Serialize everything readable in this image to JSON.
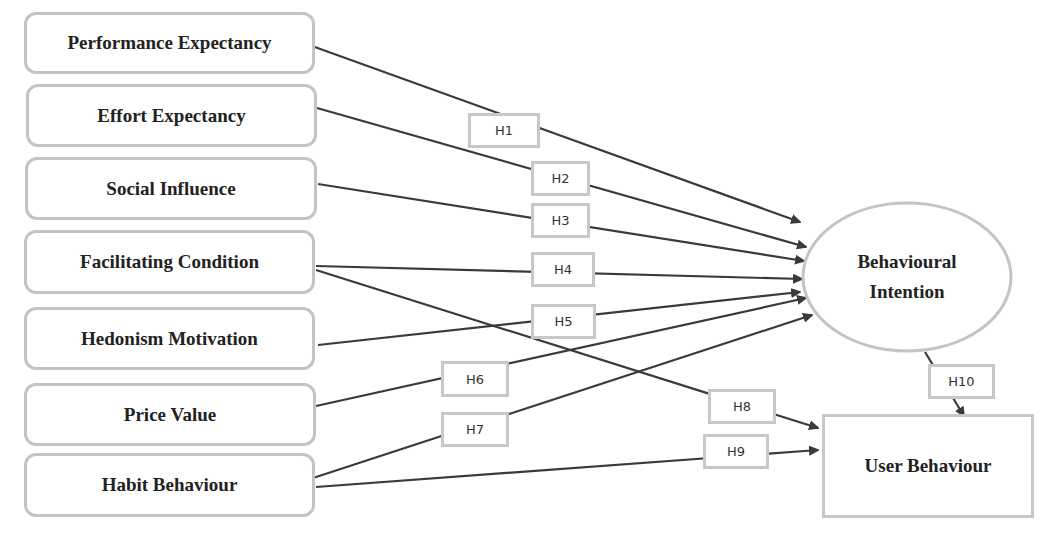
{
  "diagram": {
    "type": "research-model",
    "independent_variables": [
      {
        "id": "pe",
        "label": "Performance Expectancy"
      },
      {
        "id": "ee",
        "label": "Effort Expectancy"
      },
      {
        "id": "si",
        "label": "Social Influence"
      },
      {
        "id": "fc",
        "label": "Facilitating Condition"
      },
      {
        "id": "hm",
        "label": "Hedonism Motivation"
      },
      {
        "id": "pv",
        "label": "Price Value"
      },
      {
        "id": "hb",
        "label": "Habit Behaviour"
      }
    ],
    "mediator": {
      "id": "bi",
      "label_line1": "Behavioural",
      "label_line2": "Intention"
    },
    "outcome": {
      "id": "ub",
      "label": "User Behaviour"
    },
    "hypotheses": [
      {
        "id": "H1",
        "label": "H1",
        "from": "Performance Expectancy",
        "to": "Behavioural Intention"
      },
      {
        "id": "H2",
        "label": "H2",
        "from": "Effort Expectancy",
        "to": "Behavioural Intention"
      },
      {
        "id": "H3",
        "label": "H3",
        "from": "Social Influence",
        "to": "Behavioural Intention"
      },
      {
        "id": "H4",
        "label": "H4",
        "from": "Facilitating Condition",
        "to": "Behavioural Intention"
      },
      {
        "id": "H5",
        "label": "H5",
        "from": "Hedonism Motivation",
        "to": "Behavioural Intention"
      },
      {
        "id": "H6",
        "label": "H6",
        "from": "Price Value",
        "to": "Behavioural Intention"
      },
      {
        "id": "H7",
        "label": "H7",
        "from": "Habit Behaviour",
        "to": "Behavioural Intention"
      },
      {
        "id": "H8",
        "label": "H8",
        "from": "Facilitating Condition",
        "to": "User Behaviour"
      },
      {
        "id": "H9",
        "label": "H9",
        "from": "Habit Behaviour",
        "to": "User Behaviour"
      },
      {
        "id": "H10",
        "label": "H10",
        "from": "Behavioural Intention",
        "to": "User Behaviour"
      }
    ],
    "colors": {
      "box_border": "#c4c4c4",
      "arrow": "#3a3a3a",
      "text": "#222222"
    }
  }
}
